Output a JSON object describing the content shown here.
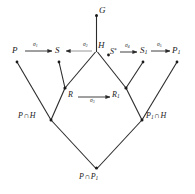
{
  "diagram": {
    "type": "lattice-commutative-diagram",
    "background_color": "#ffffff",
    "line_color": "#2b2b2b",
    "text_color": "#1a1a1a",
    "width": 195,
    "height": 194,
    "nodes": {
      "G": {
        "label": "G",
        "x": 97,
        "y": 11
      },
      "P": {
        "label": "P",
        "x": 15,
        "y": 52
      },
      "S": {
        "label": "S",
        "x": 58,
        "y": 52
      },
      "H": {
        "label": "H",
        "x": 99,
        "y": 47
      },
      "Sstar": {
        "label": "S*",
        "x": 110,
        "y": 53
      },
      "S1": {
        "label": "S1",
        "x": 143,
        "y": 52
      },
      "P1": {
        "label": "P1",
        "x": 175,
        "y": 52
      },
      "R": {
        "label": "R",
        "x": 69,
        "y": 97
      },
      "R1": {
        "label": "R1",
        "x": 118,
        "y": 97
      },
      "PcapH": {
        "label": "P∩H",
        "x": 21,
        "y": 117
      },
      "P1capH": {
        "label": "P1∩H",
        "x": 140,
        "y": 117
      },
      "PcapP1": {
        "label": "P∩P1",
        "x": 78,
        "y": 178
      }
    },
    "arrows": [
      {
        "name": "sigma-1",
        "label": "σ",
        "subscript": "1",
        "from": "P",
        "to": "S",
        "direction": "right"
      },
      {
        "name": "sigma-2",
        "label": "σ",
        "subscript": "2",
        "from": "H",
        "to": "S",
        "direction": "left"
      },
      {
        "name": "sigma-4",
        "label": "σ",
        "subscript": "4",
        "from": "S*",
        "to": "S1",
        "direction": "right"
      },
      {
        "name": "sigma-5",
        "label": "σ",
        "subscript": "5",
        "from": "S1",
        "to": "P1",
        "direction": "right"
      },
      {
        "name": "sigma-3",
        "label": "σ",
        "subscript": "3",
        "from": "R",
        "to": "R1",
        "direction": "right"
      }
    ],
    "labels": {
      "G": "G",
      "P": "P",
      "S": "S",
      "H": "H",
      "S_star_base": "S",
      "S_star_sup": "*",
      "S1_base": "S",
      "S1_sub": "1",
      "P1_base": "P",
      "P1_sub": "1",
      "R": "R",
      "R1_base": "R",
      "R1_sub": "1",
      "P_cap_H_left": "P",
      "P_cap_H_cap": "∩",
      "P_cap_H_right": "H",
      "P1_cap_H_left": "P",
      "P1_cap_H_sub": "1",
      "P1_cap_H_cap": "∩",
      "P1_cap_H_right": "H",
      "P_cap_P1_left": "P",
      "P_cap_P1_cap": "∩",
      "P_cap_P1_right": "P",
      "P_cap_P1_sub": "1",
      "sigma": "σ",
      "s1": "1",
      "s2": "2",
      "s3": "3",
      "s4": "4",
      "s5": "5"
    }
  }
}
